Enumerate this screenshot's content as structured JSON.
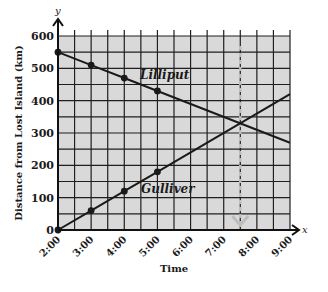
{
  "chart_data": {
    "type": "line",
    "title": "",
    "xlabel": "Time",
    "ylabel": "Distance from Lost Island (km)",
    "x_axis_letter": "x",
    "y_axis_letter": "y",
    "categories": [
      "2:00",
      "3:00",
      "4:00",
      "5:00",
      "6:00",
      "7:00",
      "8:00",
      "9:00"
    ],
    "x_hours": [
      2,
      3,
      4,
      5,
      6,
      7,
      8,
      9
    ],
    "yticks": [
      0,
      100,
      200,
      300,
      400,
      500,
      600
    ],
    "ylim": [
      0,
      600
    ],
    "xlim": [
      2,
      9
    ],
    "grid": true,
    "grid_minor_step_y": 50,
    "grid_minor_step_x": 0.5,
    "series": [
      {
        "name": "Lilliput",
        "x": [
          2,
          3,
          4,
          5,
          9
        ],
        "values": [
          550,
          510,
          470,
          430,
          270
        ],
        "marked_points": [
          [
            2,
            550
          ],
          [
            3,
            510
          ],
          [
            4,
            470
          ],
          [
            5,
            430
          ]
        ]
      },
      {
        "name": "Gulliver",
        "x": [
          2,
          3,
          4,
          5,
          9
        ],
        "values": [
          0,
          60,
          120,
          180,
          420
        ],
        "marked_points": [
          [
            2,
            0
          ],
          [
            3,
            60
          ],
          [
            4,
            120
          ],
          [
            5,
            180
          ]
        ]
      }
    ],
    "annotations": [
      {
        "type": "dashed-vertical-arrow",
        "x": 7.5,
        "from_y": 600,
        "to_y": 0,
        "note": "intersection near 7:30, ~330 km"
      }
    ],
    "colors": {
      "grid_bg": "#d9d9d9",
      "grid_line": "#1f1f1f",
      "line": "#1a1a1a",
      "annotation": "#bdbdbd"
    }
  }
}
